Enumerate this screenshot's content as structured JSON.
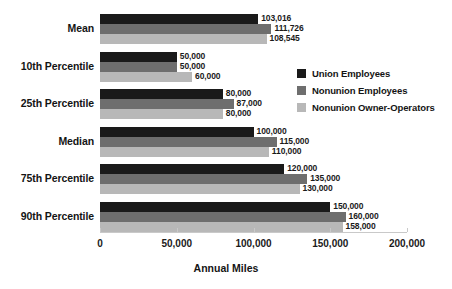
{
  "chart_data": {
    "type": "bar",
    "orientation": "horizontal",
    "title": "",
    "xlabel": "Annual Miles",
    "ylabel": "",
    "xlim": [
      0,
      200000
    ],
    "xticks": [
      0,
      50000,
      100000,
      150000,
      200000
    ],
    "xtick_labels": [
      "0",
      "50,000",
      "100,000",
      "150,000",
      "200,000"
    ],
    "grid": false,
    "legend_position": "right",
    "categories": [
      "Mean",
      "10th Percentile",
      "25th Percentile",
      "Median",
      "75th Percentile",
      "90th Percentile"
    ],
    "series": [
      {
        "name": "Union Employees",
        "color": "#1a1a1a",
        "values": [
          103016,
          50000,
          80000,
          100000,
          120000,
          150000
        ],
        "labels": [
          "103,016",
          "50,000",
          "80,000",
          "100,000",
          "120,000",
          "150,000"
        ]
      },
      {
        "name": "Nonunion Employees",
        "color": "#6e6e6e",
        "values": [
          111726,
          50000,
          87000,
          115000,
          135000,
          160000
        ],
        "labels": [
          "111,726",
          "50,000",
          "87,000",
          "115,000",
          "135,000",
          "160,000"
        ]
      },
      {
        "name": "Nonunion Owner-Operators",
        "color": "#b8b8b8",
        "values": [
          108545,
          60000,
          80000,
          110000,
          130000,
          158000
        ],
        "labels": [
          "108,545",
          "60,000",
          "80,000",
          "110,000",
          "130,000",
          "158,000"
        ]
      }
    ]
  },
  "legend": {
    "items": [
      {
        "label": "Union Employees",
        "color": "#1a1a1a"
      },
      {
        "label": "Nonunion Employees",
        "color": "#6e6e6e"
      },
      {
        "label": "Nonunion Owner-Operators",
        "color": "#b8b8b8"
      }
    ]
  },
  "axis": {
    "x_title": "Annual Miles",
    "tick_labels": [
      "0",
      "50,000",
      "100,000",
      "150,000",
      "200,000"
    ]
  }
}
